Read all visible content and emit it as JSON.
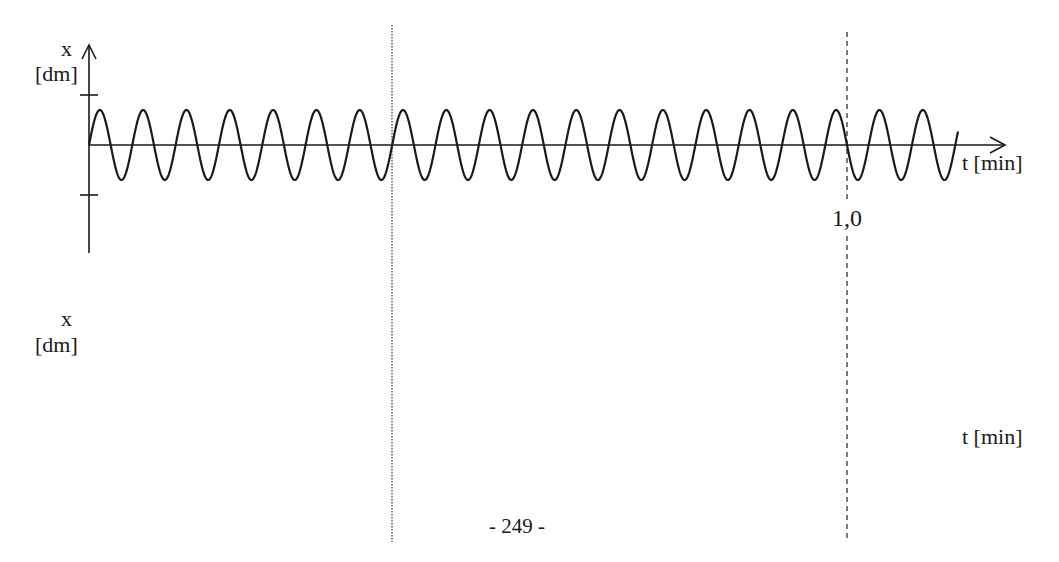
{
  "chart_data": [
    {
      "type": "line",
      "title": "",
      "xlabel": "t [min]",
      "ylabel_symbol": "x",
      "ylabel_unit": "[dm]",
      "x_tick_labels": [
        {
          "value": 1.0,
          "label": "1,0"
        }
      ],
      "y_ticks": [
        "+A_max",
        "-A_max"
      ],
      "series": [
        {
          "name": "x(t)",
          "function": "sine",
          "start_t": 0,
          "end_t": 1.147,
          "periods_per_min": 17.5,
          "cycles_shown": 20,
          "amplitude_relative_to_tick": 0.7,
          "phase": "starts at zero, rising"
        }
      ],
      "vertical_markers": [
        {
          "t": 0.4,
          "style": "dotted"
        },
        {
          "t": 1.0,
          "style": "dashed"
        }
      ],
      "grid": false,
      "legend": null
    },
    {
      "type": "line",
      "title": "",
      "xlabel": "t [min]",
      "ylabel_symbol": "x",
      "ylabel_unit": "[dm]",
      "series": [],
      "note": "empty axes area (to be drawn)"
    }
  ],
  "top_plot": {
    "y_symbol": "x",
    "y_unit": "[dm]",
    "x_label": "t [min]",
    "tick_label": "1,0"
  },
  "bottom_plot": {
    "y_symbol": "x",
    "y_unit": "[dm]",
    "x_label": "t [min]"
  },
  "page_number": "- 249 -",
  "colors": {
    "ink": "#1a1a1a",
    "paper": "#ffffff"
  }
}
